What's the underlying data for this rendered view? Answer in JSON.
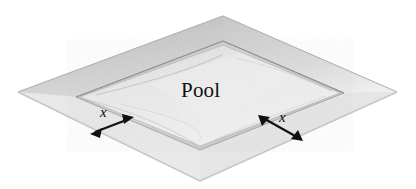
{
  "figure": {
    "name": "pool-with-walkway-diagram",
    "type": "geometry-diagram",
    "background_color": "#ffffff",
    "labels": {
      "pool": "Pool",
      "walk_width_left": "x",
      "walk_width_right": "x"
    },
    "colors": {
      "deck_light": "#e2e2e2",
      "deck_mid": "#d4d4d4",
      "deck_shadow": "#bdbdbd",
      "pool_surface": "#ebebeb",
      "pool_rim": "#c7c7c7",
      "outline": "#8e8e8e",
      "arrow": "#111111",
      "text": "#101010"
    },
    "shapes": {
      "deck_quad": {
        "name": "outer-deck",
        "points": "18,92 223,16 397,92 200,181"
      },
      "pool_quad": {
        "name": "inner-pool",
        "points": "78,97 223,43 342,93 200,148"
      }
    },
    "arrows": {
      "left": {
        "name": "walk-width-arrow-left",
        "from": [
          92,
          134
        ],
        "to": [
          132,
          118
        ],
        "label_x": 104,
        "label_y": 114
      },
      "right": {
        "name": "walk-width-arrow-right",
        "from": [
          258,
          116
        ],
        "to": [
          300,
          140
        ],
        "label_x": 282,
        "label_y": 121
      }
    }
  }
}
